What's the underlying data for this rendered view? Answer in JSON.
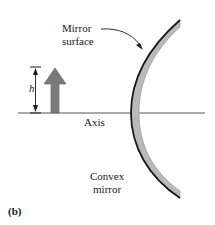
{
  "figure": {
    "panel_label": "(b)",
    "type": "optics-ray-diagram"
  },
  "labels": {
    "mirror_surface_line1": "Mirror",
    "mirror_surface_line2": "surface",
    "axis": "Axis",
    "object_height": "h",
    "convex_mirror_line1": "Convex",
    "convex_mirror_line2": "mirror"
  },
  "colors": {
    "background": "#ffffff",
    "object_arrow_fill": "#7a7a7a",
    "object_arrow_stroke": "#5f5f5f",
    "mirror_band_fill": "#b9b9b9",
    "mirror_reflective_edge": "#1a1a1a",
    "axis_line": "#555555",
    "text": "#1a1a1a",
    "leader_line": "#1a1a1a",
    "dimension_line": "#1a1a1a"
  },
  "geometry": {
    "axis_y": 113,
    "axis_x_start": 18,
    "axis_x_end": 205,
    "mirror_vertex_x": 133,
    "mirror_top_x": 180,
    "mirror_top_y": 20,
    "mirror_bottom_x": 180,
    "mirror_bottom_y": 198,
    "mirror_thickness": 9,
    "object_arrow_x": 55,
    "object_base_y": 113,
    "object_tip_y": 68,
    "object_height_px": 45,
    "dimension_line_x": 35,
    "dimension_top_y": 67,
    "dimension_bottom_y": 113
  }
}
